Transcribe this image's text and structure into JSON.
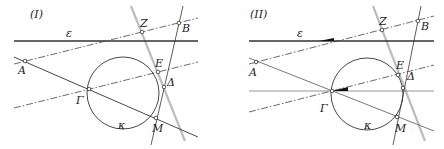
{
  "panels": [
    {
      "title": "(I)",
      "labels": {
        "line_epsilon": "ε",
        "A": "A",
        "B": "B",
        "Z": "Z",
        "E": "E",
        "Delta": "Δ",
        "Gamma": "Γ",
        "M": "M",
        "circle_kappa": "κ"
      }
    },
    {
      "title": "(II)",
      "labels": {
        "line_epsilon": "ε",
        "A": "A",
        "B": "B",
        "Z": "Z",
        "E": "E",
        "Delta": "Δ",
        "Gamma": "Γ",
        "M": "M",
        "circle_kappa": "κ"
      }
    }
  ],
  "colors": {
    "line": "#333333",
    "grey_line": "#b5b5b5",
    "point_fill": "#ffffff"
  }
}
